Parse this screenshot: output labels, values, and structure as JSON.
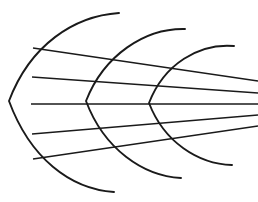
{
  "figure": {
    "type": "line-drawing",
    "canvas": {
      "width": 258,
      "height": 202,
      "background": "#ffffff"
    },
    "stroke": {
      "color": "#1a1a1a",
      "arc_width": 1.9,
      "ray_width": 1.7
    },
    "vanishing_point": {
      "x": 262,
      "y": 103
    },
    "arcs": [
      {
        "name": "arc-outer",
        "label": "Outer arc",
        "opens": "right",
        "leftmost_x": 9,
        "center_y": 101,
        "top_end": {
          "x": 119,
          "y": 13
        },
        "bottom_end": {
          "x": 114,
          "y": 192
        },
        "apex": {
          "x": 9,
          "y": 101
        },
        "path": "M 119 13 C 74 16, 30 45, 9 101 C 30 158, 70 189, 114 192"
      },
      {
        "name": "arc-middle",
        "label": "Middle arc",
        "opens": "right",
        "leftmost_x": 86,
        "center_y": 101,
        "top_end": {
          "x": 185,
          "y": 29
        },
        "bottom_end": {
          "x": 181,
          "y": 178
        },
        "apex": {
          "x": 86,
          "y": 101
        },
        "path": "M 185 29 C 145 28, 104 55, 86 101 C 104 149, 143 176, 181 178"
      },
      {
        "name": "arc-inner",
        "label": "Inner arc",
        "opens": "right",
        "leftmost_x": 149,
        "center_y": 103,
        "top_end": {
          "x": 234,
          "y": 46
        },
        "bottom_end": {
          "x": 232,
          "y": 165
        },
        "apex": {
          "x": 149,
          "y": 103
        },
        "path": "M 234 46 C 199 43, 164 64, 149 103 C 164 142, 198 164, 232 165"
      }
    ],
    "rays": [
      {
        "name": "ray-1",
        "label": "Top line",
        "start": {
          "x": 33,
          "y": 48
        },
        "end": {
          "x": 258,
          "y": 81
        },
        "path": "M 33 48 L 258 81"
      },
      {
        "name": "ray-2",
        "label": "Upper-middle line",
        "start": {
          "x": 32,
          "y": 77
        },
        "end": {
          "x": 258,
          "y": 93
        },
        "path": "M 32 77 L 258 93"
      },
      {
        "name": "ray-3",
        "label": "Center line",
        "start": {
          "x": 31,
          "y": 104
        },
        "end": {
          "x": 258,
          "y": 104
        },
        "path": "M 31 104 L 258 104"
      },
      {
        "name": "ray-4",
        "label": "Lower-middle line",
        "start": {
          "x": 32,
          "y": 134
        },
        "end": {
          "x": 258,
          "y": 115
        },
        "path": "M 32 134 L 258 115"
      },
      {
        "name": "ray-5",
        "label": "Bottom line",
        "start": {
          "x": 33,
          "y": 159
        },
        "end": {
          "x": 258,
          "y": 126
        },
        "path": "M 33 159 L 258 126"
      }
    ]
  }
}
